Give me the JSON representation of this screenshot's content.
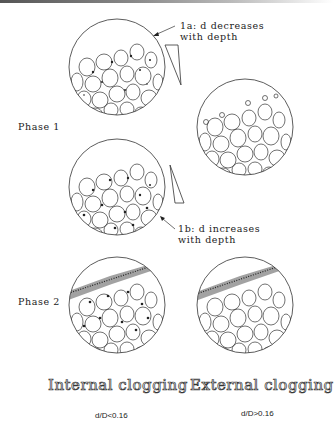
{
  "figure": {
    "phase_labels": [
      "Phase 1",
      "Phase 2"
    ],
    "annotations": {
      "a": {
        "line1": "1a: d decreases",
        "line2": "with depth"
      },
      "b": {
        "line1": "1b: d increases",
        "line2": "with depth"
      }
    },
    "column_titles": [
      "Internal clogging",
      "External clogging"
    ],
    "ratios": [
      "d/D<0.16",
      "d/D>0.16"
    ]
  }
}
